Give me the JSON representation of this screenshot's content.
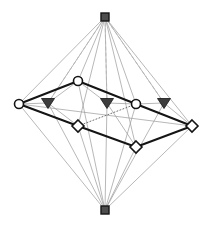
{
  "figure": {
    "title": "",
    "type": "lattice-graph-diagram",
    "width": 205,
    "height": 226,
    "background": "#ffffff"
  },
  "styles": {
    "thick_edge_color": "#151515",
    "thick_edge_width": 2.0,
    "thin_edge_color": "#9a9a9a",
    "thin_edge_width": 0.7,
    "dashed_edge_color": "#b3b3b3",
    "dotted_edge_color": "#6e6e6e",
    "node_stroke": "#141414",
    "node_fill_open": "#ffffff",
    "node_fill_solid": "#4d4d4d",
    "triangle_fill": "#3d3d3d"
  },
  "nodes": [
    {
      "id": "top",
      "label": "top apex",
      "shape": "square",
      "fill": "solid",
      "x": 105,
      "y": 17,
      "size": 8
    },
    {
      "id": "bottom",
      "label": "bottom apex",
      "shape": "square",
      "fill": "solid",
      "x": 105,
      "y": 210,
      "size": 8
    },
    {
      "id": "c1",
      "label": "circle left",
      "shape": "circle",
      "fill": "open",
      "x": 19,
      "y": 104,
      "size": 9
    },
    {
      "id": "c2",
      "label": "circle upper middle",
      "shape": "circle",
      "fill": "open",
      "x": 78,
      "y": 81,
      "size": 9
    },
    {
      "id": "c3",
      "label": "circle right",
      "shape": "circle",
      "fill": "open",
      "x": 136,
      "y": 104,
      "size": 9
    },
    {
      "id": "t1",
      "label": "triangle left",
      "shape": "triangle",
      "fill": "solid",
      "x": 48,
      "y": 103,
      "size": 9
    },
    {
      "id": "t2",
      "label": "triangle middle",
      "shape": "triangle",
      "fill": "solid",
      "x": 107,
      "y": 103,
      "size": 9
    },
    {
      "id": "t3",
      "label": "triangle right",
      "shape": "triangle",
      "fill": "solid",
      "x": 164,
      "y": 103,
      "size": 9
    },
    {
      "id": "d1",
      "label": "diamond left",
      "shape": "diamond",
      "fill": "open",
      "x": 78,
      "y": 126,
      "size": 9
    },
    {
      "id": "d2",
      "label": "diamond lower",
      "shape": "diamond",
      "fill": "open",
      "x": 136,
      "y": 147,
      "size": 9
    },
    {
      "id": "d3",
      "label": "diamond right",
      "shape": "diamond",
      "fill": "open",
      "x": 192,
      "y": 126,
      "size": 9
    }
  ],
  "edges": {
    "thick": [
      {
        "from": "c1",
        "to": "c2"
      },
      {
        "from": "c2",
        "to": "c3"
      },
      {
        "from": "c3",
        "to": "d3"
      },
      {
        "from": "d3",
        "to": "d2"
      },
      {
        "from": "d2",
        "to": "d1"
      },
      {
        "from": "d1",
        "to": "c1"
      }
    ],
    "dotted": [
      {
        "from": "c1",
        "to": "d1"
      },
      {
        "from": "d1",
        "to": "c3"
      },
      {
        "from": "c3",
        "to": "d3"
      }
    ],
    "thin_from_top": [
      "c1",
      "c2",
      "c3",
      "t1",
      "t2",
      "t3",
      "d1",
      "d2",
      "d3"
    ],
    "thin_from_bottom": [
      "c1",
      "c2",
      "c3",
      "t1",
      "t2",
      "t3",
      "d1",
      "d2",
      "d3"
    ],
    "dashed_from_top": [
      "t1",
      "t2",
      "t3"
    ],
    "thin_internal": [
      {
        "from": "c1",
        "to": "t1"
      },
      {
        "from": "t1",
        "to": "c2"
      },
      {
        "from": "c2",
        "to": "t2"
      },
      {
        "from": "t2",
        "to": "c3"
      },
      {
        "from": "c3",
        "to": "t3"
      },
      {
        "from": "t3",
        "to": "d3"
      },
      {
        "from": "t1",
        "to": "d1"
      },
      {
        "from": "t2",
        "to": "d2"
      },
      {
        "from": "c1",
        "to": "d3"
      }
    ]
  },
  "chart_data": {
    "type": "diagram",
    "title": "",
    "node_count": 11,
    "shape_legend": [
      {
        "shape": "square",
        "count": 2,
        "description": "filled square apex nodes (top and bottom)"
      },
      {
        "shape": "circle",
        "count": 3,
        "description": "open circle nodes on upper band"
      },
      {
        "shape": "triangle",
        "count": 3,
        "description": "filled down-pointing triangle nodes"
      },
      {
        "shape": "diamond",
        "count": 3,
        "description": "open diamond nodes on lower band"
      }
    ],
    "line_legend": [
      {
        "style": "thick-solid",
        "description": "highlighted hexagonal cycle path"
      },
      {
        "style": "thin-solid",
        "description": "lattice connection edges"
      },
      {
        "style": "dotted",
        "description": "hidden/back connection edges"
      },
      {
        "style": "dashed",
        "description": "occluded edges from top apex"
      }
    ]
  }
}
